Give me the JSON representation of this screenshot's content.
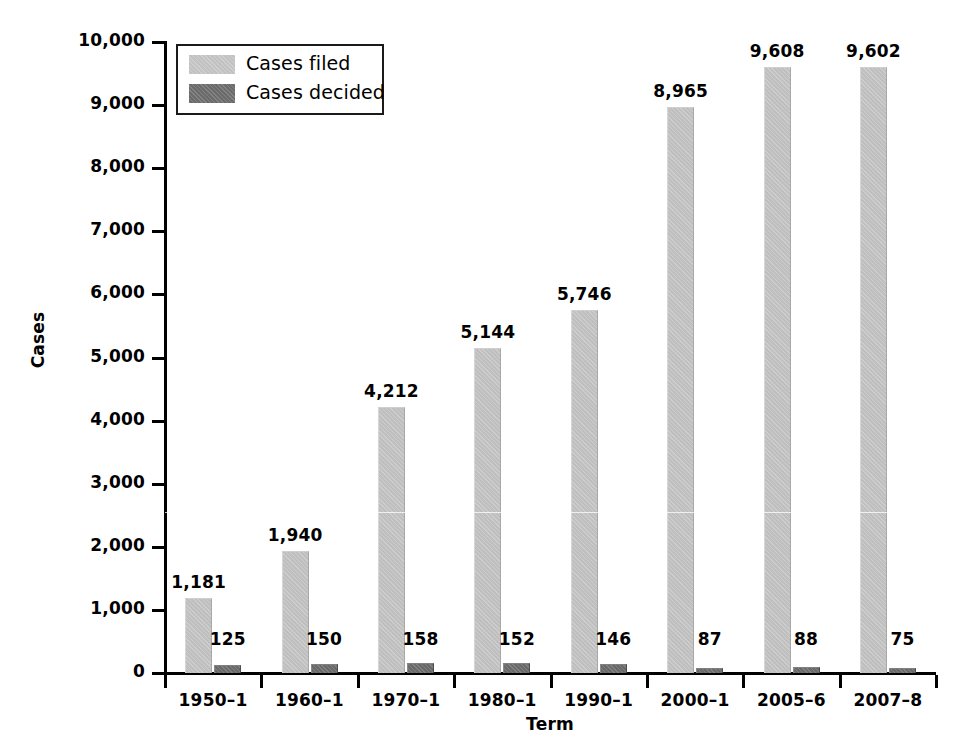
{
  "chart_data": {
    "type": "bar",
    "title": "",
    "xlabel": "Term",
    "ylabel": "Cases",
    "ylim": [
      0,
      10000
    ],
    "ytick_labels": [
      "10,000",
      "9,000",
      "8,000",
      "7,000",
      "6,000",
      "5,000",
      "4,000",
      "3,000",
      "2,000",
      "1,000",
      "0"
    ],
    "ytick_values": [
      10000,
      9000,
      8000,
      7000,
      6000,
      5000,
      4000,
      3000,
      2000,
      1000,
      0
    ],
    "grid": false,
    "legend_position": "upper-left-inside",
    "categories": [
      "1950–1",
      "1960–1",
      "1970–1",
      "1980–1",
      "1990–1",
      "2000–1",
      "2005–6",
      "2007–8"
    ],
    "series": [
      {
        "name": "Cases filed",
        "color": "#bfbfbf",
        "values": [
          1181,
          1940,
          4212,
          5144,
          5746,
          8965,
          9608,
          9602
        ],
        "value_labels": [
          "1,181",
          "1,940",
          "4,212",
          "5,144",
          "5,746",
          "8,965",
          "9,608",
          "9,602"
        ]
      },
      {
        "name": "Cases decided",
        "color": "#696969",
        "values": [
          125,
          150,
          158,
          152,
          146,
          87,
          88,
          75
        ],
        "value_labels": [
          "125",
          "150",
          "158",
          "152",
          "146",
          "87",
          "88",
          "75"
        ]
      }
    ]
  },
  "legend": {
    "items": [
      {
        "label": "Cases filed",
        "swatch": "legend-swatch-filed"
      },
      {
        "label": "Cases decided",
        "swatch": "legend-swatch-decided"
      }
    ]
  },
  "colors": {
    "cases_filed": "#bfbfbf",
    "cases_decided": "#696969",
    "axis": "#000000",
    "background": "#ffffff"
  }
}
